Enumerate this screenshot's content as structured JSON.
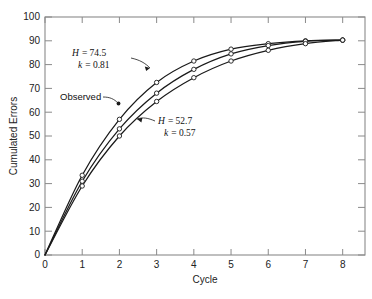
{
  "figure": {
    "background": "#ffffff",
    "frame_color": "#8a8a8a",
    "curve_color": "#1a1a1a",
    "marker_fill": "#ffffff"
  },
  "axes": {
    "x_title": "Cycle",
    "y_title": "Cumulated Errors",
    "x_ticks": [
      "0",
      "1",
      "2",
      "3",
      "4",
      "5",
      "6",
      "7",
      "8"
    ],
    "y_ticks": [
      "0",
      "10",
      "20",
      "30",
      "40",
      "50",
      "60",
      "70",
      "80",
      "90",
      "100"
    ]
  },
  "annotations": {
    "upper": {
      "line1_var": "H",
      "line1_eq": "= 74.5",
      "line2_var": "k",
      "line2_eq": "= 0.81",
      "full": "H = 74.5  k = 0.81"
    },
    "lower": {
      "line1_var": "H",
      "line1_eq": "= 52.7",
      "line2_var": "k",
      "line2_eq": "= 0.57",
      "full": "H = 52.7  k = 0.57"
    },
    "observed_label": "Observed"
  },
  "chart_data": {
    "type": "line",
    "title": "",
    "xlabel": "Cycle",
    "ylabel": "Cumulated Errors",
    "xlim": [
      0,
      8.6
    ],
    "ylim": [
      0,
      100
    ],
    "x_ticks": [
      0,
      1,
      2,
      3,
      4,
      5,
      6,
      7,
      8
    ],
    "y_ticks": [
      0,
      10,
      20,
      30,
      40,
      50,
      60,
      70,
      80,
      90,
      100
    ],
    "grid": false,
    "legend": "annotated on curves",
    "x": [
      0,
      1,
      2,
      3,
      4,
      5,
      6,
      7,
      8
    ],
    "series": [
      {
        "name": "H = 74.5, k = 0.81",
        "label": "H = 74.5  k = 0.81",
        "H": 74.5,
        "k": 0.81,
        "markers": true,
        "values": [
          0,
          33.5,
          57.0,
          72.5,
          81.5,
          86.5,
          88.8,
          90.0,
          90.3
        ]
      },
      {
        "name": "Observed",
        "label": "Observed",
        "markers": true,
        "values": [
          0,
          31.0,
          53.0,
          68.0,
          78.0,
          84.5,
          88.0,
          89.8,
          90.3
        ]
      },
      {
        "name": "H = 52.7, k = 0.57",
        "label": "H = 52.7  k = 0.57",
        "H": 52.7,
        "k": 0.57,
        "markers": true,
        "values": [
          0,
          29.0,
          50.0,
          64.5,
          74.5,
          81.5,
          86.0,
          88.8,
          90.3
        ]
      }
    ]
  }
}
